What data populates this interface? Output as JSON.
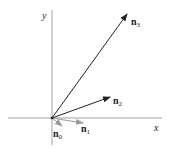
{
  "diagram": {
    "axes": {
      "x_label": "x",
      "y_label": "y",
      "color": "#888888"
    },
    "origin": [
      52,
      118
    ],
    "vectors": [
      {
        "name": "n",
        "subscript": "0",
        "to": [
          62,
          126
        ],
        "color": "#9a9a9a"
      },
      {
        "name": "n",
        "subscript": "1",
        "to": [
          83,
          123
        ],
        "color": "#9a9a9a"
      },
      {
        "name": "n",
        "subscript": "2",
        "to": [
          110,
          97
        ],
        "color": "#222222"
      },
      {
        "name": "n",
        "subscript": "3",
        "to": [
          127,
          14
        ],
        "color": "#222222"
      }
    ]
  }
}
